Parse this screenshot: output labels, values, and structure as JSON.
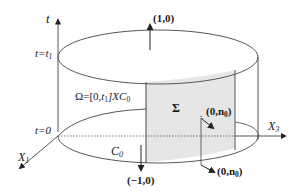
{
  "diagram": {
    "type": "space-time cylinder",
    "axes": {
      "t": "t",
      "x1": "X",
      "x1_sub": "1",
      "x3": "X",
      "x3_sub": "3"
    },
    "time_levels": {
      "top": "t=t",
      "top_sub": "1",
      "bottom": "t=0"
    },
    "domain_label": {
      "prefix": "Ω=[0,",
      "t": "t",
      "t_sub": "1",
      "mid": "]X",
      "c": "C",
      "c_sub": "0"
    },
    "surface_label": "Σ",
    "curve_label": {
      "c": "C",
      "c_sub": "0"
    },
    "normals": {
      "top": "(1,0)",
      "bottom": "(−1,0)",
      "lateral_inner": {
        "open": "(0,",
        "n": "n",
        "n_sub": "0",
        "close": ")"
      },
      "lateral_outer": {
        "open": "(0,",
        "n": "n",
        "n_sub": "0",
        "close": ")"
      }
    },
    "colors": {
      "line": "#333333",
      "panel_fill": "#e6e6e6",
      "text": "#1a1a1a"
    }
  }
}
